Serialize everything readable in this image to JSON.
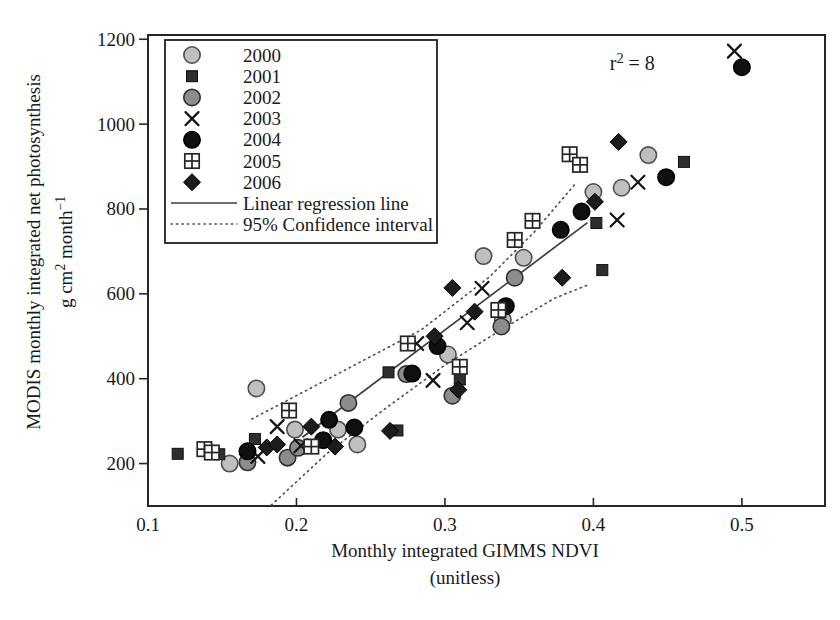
{
  "chart_data": {
    "type": "scatter",
    "xlabel": "Monthly integrated GIMMS NDVI",
    "xlabel_sub": "(unitless)",
    "ylabel": "MODIS monthly integrated net photosynthesis",
    "ylabel_units_parts": [
      [
        "t",
        "g cm"
      ],
      [
        "s",
        "2"
      ],
      [
        "t",
        " month"
      ],
      [
        "s",
        "−1"
      ]
    ],
    "xlim": [
      0.1,
      0.556
    ],
    "ylim": [
      100,
      1210
    ],
    "xticks": [
      0.1,
      0.2,
      0.3,
      0.4,
      0.5
    ],
    "xtick_labels": [
      "0.1",
      "0.2",
      "0.3",
      "0.4",
      "0.5"
    ],
    "yticks": [
      200,
      400,
      600,
      800,
      1000,
      1200
    ],
    "ytick_labels": [
      "200",
      "400",
      "600",
      "800",
      "1000",
      "1200"
    ],
    "grid": false,
    "legend_position": "top-left",
    "annotation": {
      "parts": [
        [
          "t",
          "r"
        ],
        [
          "s",
          "2"
        ],
        [
          "t",
          " = 8"
        ]
      ],
      "x": 0.411,
      "y": 1127
    },
    "series": [
      {
        "name": "2000",
        "marker": "circle",
        "fill": "#bfbfbf",
        "edge": "#4d4d4d",
        "points": [
          [
            0.155,
            200
          ],
          [
            0.173,
            377
          ],
          [
            0.199,
            280
          ],
          [
            0.228,
            280
          ],
          [
            0.241,
            245
          ],
          [
            0.302,
            457
          ],
          [
            0.326,
            689
          ],
          [
            0.339,
            539
          ],
          [
            0.353,
            685
          ],
          [
            0.4,
            840
          ],
          [
            0.419,
            850
          ],
          [
            0.437,
            927
          ]
        ]
      },
      {
        "name": "2001",
        "marker": "square",
        "fill": "#2e2e2e",
        "edge": "#111111",
        "points": [
          [
            0.12,
            223
          ],
          [
            0.148,
            222
          ],
          [
            0.172,
            258
          ],
          [
            0.262,
            415
          ],
          [
            0.268,
            278
          ],
          [
            0.31,
            398
          ],
          [
            0.402,
            767
          ],
          [
            0.406,
            656
          ],
          [
            0.461,
            911
          ]
        ]
      },
      {
        "name": "2002",
        "marker": "circle",
        "fill": "#8c8c8c",
        "edge": "#2e2e2e",
        "points": [
          [
            0.167,
            203
          ],
          [
            0.194,
            214
          ],
          [
            0.201,
            237
          ],
          [
            0.235,
            343
          ],
          [
            0.274,
            411
          ],
          [
            0.305,
            360
          ],
          [
            0.338,
            523
          ],
          [
            0.347,
            638
          ]
        ]
      },
      {
        "name": "2003",
        "marker": "x",
        "fill": "none",
        "edge": "#141414",
        "points": [
          [
            0.174,
            217
          ],
          [
            0.187,
            287
          ],
          [
            0.203,
            242
          ],
          [
            0.281,
            483
          ],
          [
            0.292,
            396
          ],
          [
            0.315,
            532
          ],
          [
            0.325,
            613
          ],
          [
            0.416,
            774
          ],
          [
            0.43,
            863
          ],
          [
            0.495,
            1172
          ]
        ]
      },
      {
        "name": "2004",
        "marker": "circle",
        "fill": "#101010",
        "edge": "#000000",
        "points": [
          [
            0.167,
            229
          ],
          [
            0.218,
            255
          ],
          [
            0.222,
            303
          ],
          [
            0.239,
            285
          ],
          [
            0.278,
            412
          ],
          [
            0.295,
            477
          ],
          [
            0.341,
            571
          ],
          [
            0.378,
            751
          ],
          [
            0.392,
            794
          ],
          [
            0.449,
            875
          ],
          [
            0.5,
            1134
          ]
        ]
      },
      {
        "name": "2005",
        "marker": "square-cross",
        "fill": "#fdfdfd",
        "edge": "#262626",
        "points": [
          [
            0.138,
            234
          ],
          [
            0.143,
            226
          ],
          [
            0.195,
            325
          ],
          [
            0.21,
            240
          ],
          [
            0.275,
            483
          ],
          [
            0.31,
            428
          ],
          [
            0.336,
            562
          ],
          [
            0.347,
            727
          ],
          [
            0.359,
            772
          ],
          [
            0.384,
            929
          ],
          [
            0.391,
            904
          ]
        ]
      },
      {
        "name": "2006",
        "marker": "diamond",
        "fill": "#1c1c1c",
        "edge": "#000000",
        "points": [
          [
            0.18,
            238
          ],
          [
            0.187,
            245
          ],
          [
            0.21,
            287
          ],
          [
            0.226,
            240
          ],
          [
            0.263,
            277
          ],
          [
            0.293,
            500
          ],
          [
            0.305,
            614
          ],
          [
            0.309,
            374
          ],
          [
            0.32,
            558
          ],
          [
            0.379,
            638
          ],
          [
            0.401,
            817
          ],
          [
            0.417,
            958
          ]
        ]
      }
    ],
    "regression_line": {
      "label": "Linear regression line",
      "points": [
        [
          0.204,
          262
        ],
        [
          0.396,
          768
        ]
      ]
    },
    "confidence_interval": {
      "label": "95% Confidence interval",
      "upper": [
        [
          0.17,
          305
        ],
        [
          0.226,
          408
        ],
        [
          0.284,
          515
        ],
        [
          0.33,
          640
        ],
        [
          0.36,
          745
        ],
        [
          0.388,
          860
        ]
      ],
      "lower": [
        [
          0.183,
          102
        ],
        [
          0.22,
          222
        ],
        [
          0.26,
          330
        ],
        [
          0.3,
          432
        ],
        [
          0.34,
          520
        ],
        [
          0.374,
          590
        ],
        [
          0.397,
          622
        ]
      ]
    },
    "colors": {
      "ink": "#1a1a1a",
      "frame": "#262626",
      "regression": "#3d3d3d",
      "ci": "#4a4a4a",
      "background": "#ffffff"
    }
  }
}
